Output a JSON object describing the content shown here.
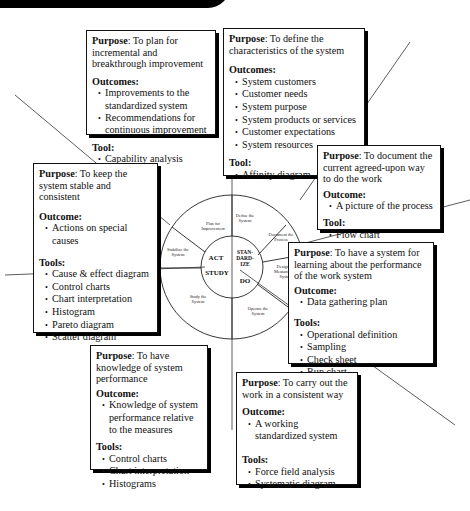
{
  "diagram": {
    "center": {
      "core": [
        "ACT",
        "STAN-\nDARD-\nIZE",
        "STUDY",
        "DO"
      ],
      "ring": [
        "Plan for Improvement",
        "Define the System",
        "Document the Process",
        "Design the Measurement System",
        "Operate the System",
        "Study the System",
        "Stabilize the System"
      ]
    },
    "boxes": {
      "plan": {
        "purpose_label": "Purpose",
        "purpose": ":  To plan for incremental and breakthrough improvement",
        "s1_label": "Outcomes:",
        "s1_items": [
          "Improvements to the standardized system",
          "Recommendations for continuous improvement"
        ],
        "s2_label": "Tool:",
        "s2_items": [
          "Capability analysis"
        ]
      },
      "define": {
        "purpose_label": "Purpose",
        "purpose": ":  To define the characteristics of the system",
        "s1_label": "Outcomes:",
        "s1_items": [
          "System customers",
          "Customer needs",
          "System purpose",
          "System products or services",
          "Customer expectations",
          "System resources"
        ],
        "s2_label": "Tool:",
        "s2_items": [
          "Affinity diagram"
        ]
      },
      "document": {
        "purpose_label": "Purpose",
        "purpose": ":  To document the current agreed-upon way to do the work",
        "s1_label": "Outcome:",
        "s1_items": [
          "A picture of the process"
        ],
        "s2_label": "Tool:",
        "s2_items": [
          "Flow chart"
        ]
      },
      "stabilize": {
        "purpose_label": "Purpose",
        "purpose": ":  To keep the system stable and consistent",
        "s1_label": "Outcome:",
        "s1_items": [
          "Actions on special causes"
        ],
        "s2_label": "Tools:",
        "s2_items": [
          "Cause & effect diagram",
          "Control charts",
          "Chart interpretation",
          "Histogram",
          "Pareto diagram",
          "Scatter diagram"
        ]
      },
      "measure": {
        "purpose_label": "Purpose",
        "purpose": ":  To have a system for learning about the performance of the work system",
        "s1_label": "Outcome:",
        "s1_items": [
          "Data gathering plan"
        ],
        "s2_label": "Tools:",
        "s2_items": [
          "Operational definition",
          "Sampling",
          "Check sheet",
          "Run chart"
        ]
      },
      "study": {
        "purpose_label": "Purpose",
        "purpose": ":  To have knowledge of system performance",
        "s1_label": "Outcome:",
        "s1_items": [
          "Knowledge of system performance relative to the measures"
        ],
        "s2_label": "Tools:",
        "s2_items": [
          "Control charts",
          "Chart interpretation",
          "Histograms"
        ]
      },
      "operate": {
        "purpose_label": "Purpose",
        "purpose": ":  To carry out the work in a consistent way",
        "s1_label": "Outcome:",
        "s1_items": [
          "A working standardized system"
        ],
        "s2_label": "Tools:",
        "s2_items": [
          "Force field analysis",
          "Systematic diagram"
        ]
      }
    }
  }
}
